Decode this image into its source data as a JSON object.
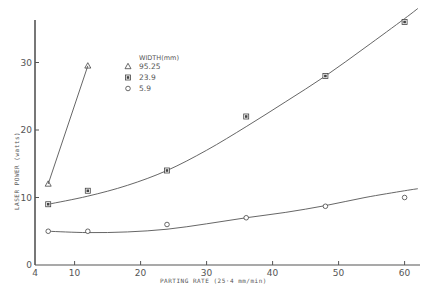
{
  "chart_data": {
    "type": "line",
    "title": "",
    "xlabel": "PARTING  RATE (25·4 mm/min)",
    "ylabel": "LASER  POWER (watts)",
    "xlim": [
      4,
      62
    ],
    "ylim": [
      0,
      37
    ],
    "x_ticks": [
      4,
      10,
      20,
      30,
      40,
      50,
      60
    ],
    "x_tick_labels": [
      "4",
      "10",
      "20",
      "30",
      "40",
      "50",
      "60"
    ],
    "y_ticks": [
      0,
      10,
      20,
      30
    ],
    "y_tick_labels": [
      "0",
      "10",
      "20",
      "30"
    ],
    "grid": false,
    "legend_title": "WIDTH(mm)",
    "legend_position": "upper-left inside",
    "series": [
      {
        "name": "95.25",
        "marker": "triangle",
        "points": [
          [
            6,
            12
          ],
          [
            12,
            29.5
          ]
        ],
        "curve": [
          [
            6,
            12
          ],
          [
            12,
            29.5
          ]
        ]
      },
      {
        "name": "23.9",
        "marker": "square-filled",
        "points": [
          [
            6,
            9
          ],
          [
            12,
            11
          ],
          [
            24,
            14
          ],
          [
            36,
            22
          ],
          [
            48,
            28
          ],
          [
            60,
            36
          ]
        ],
        "curve": [
          [
            6,
            9
          ],
          [
            12,
            10.2
          ],
          [
            18,
            11.8
          ],
          [
            24,
            14
          ],
          [
            30,
            17
          ],
          [
            36,
            20.5
          ],
          [
            42,
            24.2
          ],
          [
            48,
            28
          ],
          [
            54,
            32.2
          ],
          [
            60,
            36.5
          ],
          [
            62,
            38
          ]
        ]
      },
      {
        "name": "5.9",
        "marker": "circle",
        "points": [
          [
            6,
            5
          ],
          [
            12,
            5
          ],
          [
            24,
            6
          ],
          [
            36,
            7
          ],
          [
            48,
            8.7
          ],
          [
            60,
            10
          ]
        ],
        "curve": [
          [
            6,
            5
          ],
          [
            12,
            4.8
          ],
          [
            18,
            4.9
          ],
          [
            24,
            5.3
          ],
          [
            30,
            6.1
          ],
          [
            36,
            7
          ],
          [
            42,
            7.8
          ],
          [
            48,
            8.8
          ],
          [
            54,
            10
          ],
          [
            60,
            11
          ],
          [
            62,
            11.3
          ]
        ]
      }
    ]
  }
}
